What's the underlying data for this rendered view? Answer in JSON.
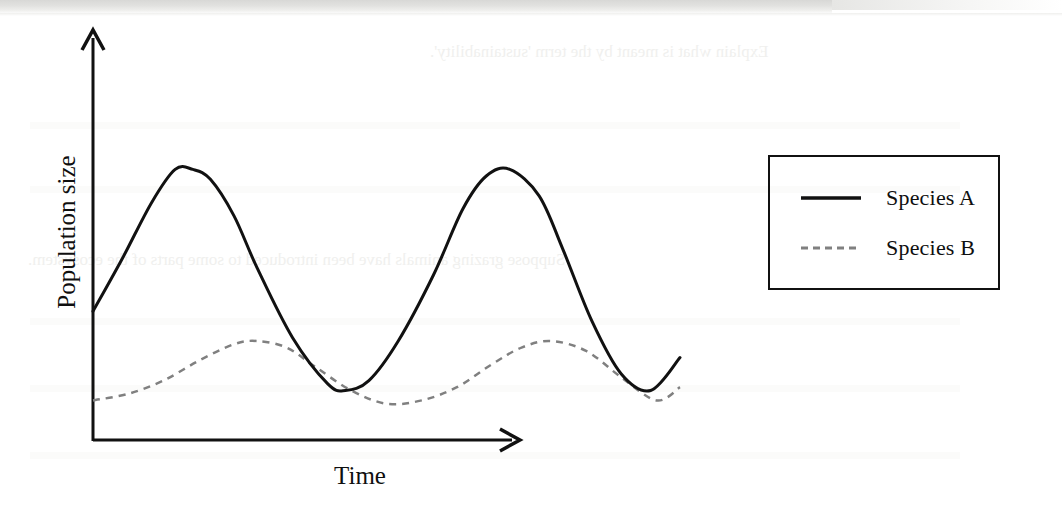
{
  "page": {
    "background_color": "#ffffff",
    "scan_strip_color": "#d8d8d6",
    "ghost_text_top": "Explain what is meant by the term 'sustainability'.",
    "ghost_text_middle": "Suppose grazing animals have been introduced to some parts of the ecosystem."
  },
  "axes": {
    "y_label": "Population size",
    "x_label": "Time",
    "axis_color": "#111111"
  },
  "legend": {
    "border_color": "#111111",
    "items": [
      {
        "label": "Species A",
        "style": "solid",
        "color": "#111111"
      },
      {
        "label": "Species B",
        "style": "dashed",
        "color": "#808080"
      }
    ]
  },
  "chart_data": {
    "type": "line",
    "title": "",
    "xlabel": "Time",
    "ylabel": "Population size",
    "grid": false,
    "legend_position": "right",
    "axis_ticks": {
      "x": [],
      "y": []
    },
    "xlim": [
      0,
      100
    ],
    "ylim": [
      0,
      100
    ],
    "series": [
      {
        "name": "Species A",
        "style": "solid",
        "color": "#111111",
        "line_width": 3,
        "amplitude": 33,
        "mean": 49,
        "period": 43,
        "phase_start_value": 39,
        "x": [
          0,
          5,
          10,
          14,
          17,
          20,
          24,
          28,
          34,
          40,
          43,
          47,
          52,
          58,
          63,
          67,
          71,
          76,
          80,
          85,
          90,
          95,
          100
        ],
        "y": [
          39,
          55,
          72,
          82,
          82,
          79,
          68,
          52,
          31,
          17,
          15,
          18,
          30,
          50,
          70,
          80,
          82,
          74,
          58,
          36,
          20,
          15,
          25
        ]
      },
      {
        "name": "Species B",
        "style": "dashed",
        "color": "#808080",
        "line_width": 2.5,
        "amplitude": 11,
        "mean": 20,
        "period": 43,
        "phase_start_value": 12,
        "x": [
          0,
          6,
          12,
          18,
          24,
          28,
          33,
          38,
          44,
          50,
          56,
          62,
          68,
          73,
          78,
          84,
          90,
          96,
          100
        ],
        "y": [
          12,
          14,
          18,
          24,
          29,
          30,
          28,
          22,
          15,
          11,
          12,
          16,
          23,
          28,
          30,
          27,
          19,
          12,
          16
        ]
      }
    ]
  }
}
